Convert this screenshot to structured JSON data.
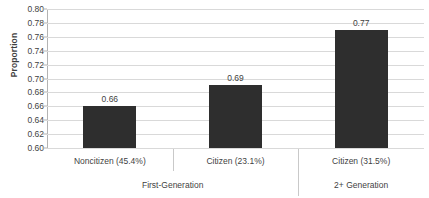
{
  "chart_data": {
    "type": "bar",
    "title": "",
    "xlabel": "",
    "ylabel": "Proportion",
    "ylim": [
      0.6,
      0.8
    ],
    "ytick_step": 0.02,
    "ytick_labels": [
      "0.80",
      "0.78",
      "0.76",
      "0.74",
      "0.72",
      "0.70",
      "0.68",
      "0.66",
      "0.64",
      "0.62",
      "0.60"
    ],
    "grid": true,
    "legend": "none",
    "bar_color": "#2e2e2e",
    "gridline_color": "#d9d9d9",
    "text_color": "#3f3f3f",
    "categories": [
      "Noncitizen (45.4%)",
      "Citizen (23.1%)",
      "Citizen (31.5%)"
    ],
    "values": [
      0.66,
      0.69,
      0.77
    ],
    "data_labels": [
      "0.66",
      "0.69",
      "0.77"
    ],
    "groups": [
      {
        "label": "First-Generation",
        "categories": [
          "Noncitizen (45.4%)",
          "Citizen (23.1%)"
        ]
      },
      {
        "label": "2+ Generation",
        "categories": [
          "Citizen (31.5%)"
        ]
      }
    ],
    "group_labels": [
      "First-Generation",
      "2+ Generation"
    ]
  }
}
